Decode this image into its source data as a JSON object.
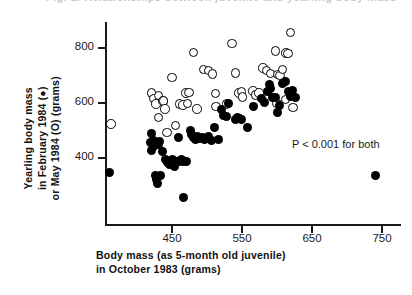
{
  "figure": {
    "top_clipped_caption": "Fig. 1. Relationships between juvenile and yearling body mass"
  },
  "annotation": {
    "text": "P < 0.001 for both"
  },
  "axes": {
    "y_title_lines": [
      "Yearling body mass",
      "in February 1984 (●)",
      "or May 1984 (O) (grams)"
    ],
    "x_title_lines": [
      "Body mass (as 5-month old juvenile)",
      "in October 1983 (grams)"
    ],
    "y_ticks": [
      400,
      600,
      800
    ],
    "x_ticks": [
      450,
      550,
      650,
      750
    ],
    "y_tick_labels": [
      "400",
      "600",
      "800"
    ],
    "x_tick_labels": [
      "450",
      "550",
      "650",
      "750"
    ]
  },
  "chart_data": {
    "type": "scatter",
    "title": "",
    "xlabel": "Body mass (as 5-month old juvenile) in October 1983 (grams)",
    "ylabel": "Yearling body mass in February 1984 (●) or May 1984 (O) (grams)",
    "xlim": [
      350,
      760
    ],
    "ylim": [
      230,
      880
    ],
    "grid": false,
    "legend_position": "none",
    "annotations": [
      {
        "text": "P < 0.001 for both",
        "x": 618,
        "y": 452
      }
    ],
    "series": [
      {
        "name": "May 1984",
        "marker": "open-circle",
        "color": "#000000",
        "filled": false,
        "points": [
          [
            363,
            524
          ],
          [
            421,
            637
          ],
          [
            424,
            616
          ],
          [
            427,
            596
          ],
          [
            431,
            627
          ],
          [
            431,
            548
          ],
          [
            437,
            608
          ],
          [
            438,
            607
          ],
          [
            440,
            578
          ],
          [
            443,
            493
          ],
          [
            450,
            692
          ],
          [
            455,
            518
          ],
          [
            461,
            596
          ],
          [
            466,
            592
          ],
          [
            470,
            637
          ],
          [
            472,
            598
          ],
          [
            474,
            639
          ],
          [
            481,
            783
          ],
          [
            486,
            579
          ],
          [
            495,
            721
          ],
          [
            502,
            719
          ],
          [
            508,
            706
          ],
          [
            512,
            634
          ],
          [
            513,
            588
          ],
          [
            528,
            597
          ],
          [
            536,
            817
          ],
          [
            541,
            709
          ],
          [
            546,
            636
          ],
          [
            549,
            641
          ],
          [
            551,
            621
          ],
          [
            566,
            643
          ],
          [
            569,
            630
          ],
          [
            574,
            636
          ],
          [
            580,
            727
          ],
          [
            585,
            718
          ],
          [
            591,
            708
          ],
          [
            598,
            790
          ],
          [
            601,
            703
          ],
          [
            604,
            700
          ],
          [
            608,
            721
          ],
          [
            613,
            781
          ],
          [
            616,
            780
          ],
          [
            619,
            857
          ],
          [
            623,
            583
          ],
          [
            612,
            613
          ],
          [
            600,
            598
          ]
        ]
      },
      {
        "name": "February 1984",
        "marker": "filled-circle",
        "color": "#000000",
        "filled": true,
        "points": [
          [
            361,
            348
          ],
          [
            419,
            455
          ],
          [
            420,
            428
          ],
          [
            421,
            488
          ],
          [
            423,
            441
          ],
          [
            424,
            464
          ],
          [
            426,
            336
          ],
          [
            428,
            322
          ],
          [
            429,
            308
          ],
          [
            431,
            449
          ],
          [
            432,
            460
          ],
          [
            434,
            337
          ],
          [
            437,
            425
          ],
          [
            441,
            393
          ],
          [
            444,
            384
          ],
          [
            446,
            375
          ],
          [
            448,
            392
          ],
          [
            451,
            396
          ],
          [
            453,
            369
          ],
          [
            456,
            386
          ],
          [
            459,
            475
          ],
          [
            461,
            389
          ],
          [
            463,
            396
          ],
          [
            466,
            388
          ],
          [
            466,
            258
          ],
          [
            471,
            387
          ],
          [
            476,
            501
          ],
          [
            478,
            487
          ],
          [
            481,
            473
          ],
          [
            484,
            466
          ],
          [
            486,
            478
          ],
          [
            489,
            470
          ],
          [
            493,
            474
          ],
          [
            497,
            466
          ],
          [
            502,
            479
          ],
          [
            506,
            465
          ],
          [
            511,
            512
          ],
          [
            517,
            466
          ],
          [
            521,
            575
          ],
          [
            524,
            556
          ],
          [
            528,
            551
          ],
          [
            531,
            599
          ],
          [
            541,
            539
          ],
          [
            544,
            546
          ],
          [
            546,
            542
          ],
          [
            549,
            540
          ],
          [
            558,
            512
          ],
          [
            566,
            589
          ],
          [
            578,
            616
          ],
          [
            582,
            603
          ],
          [
            586,
            641
          ],
          [
            589,
            668
          ],
          [
            591,
            651
          ],
          [
            594,
            620
          ],
          [
            598,
            621
          ],
          [
            601,
            565
          ],
          [
            604,
            591
          ],
          [
            608,
            672
          ],
          [
            612,
            678
          ],
          [
            616,
            643
          ],
          [
            619,
            623
          ],
          [
            622,
            645
          ],
          [
            626,
            621
          ],
          [
            740,
            338
          ]
        ]
      }
    ]
  }
}
